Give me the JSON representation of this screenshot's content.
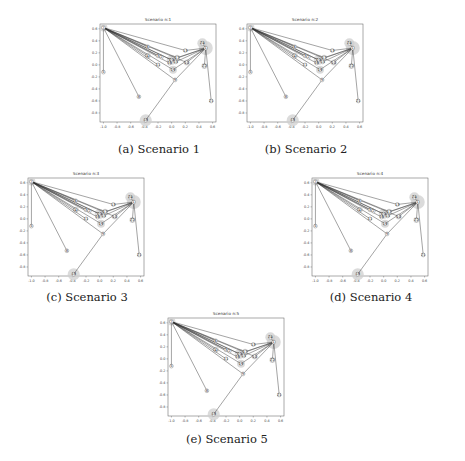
{
  "figure": {
    "panels": [
      {
        "id": "a",
        "title": "Scenario n:1",
        "caption": "(a) Scenario 1"
      },
      {
        "id": "b",
        "title": "Scenario n:2",
        "caption": "(b) Scenario 2"
      },
      {
        "id": "c",
        "title": "Scenario n:3",
        "caption": "(c) Scenario 3"
      },
      {
        "id": "d",
        "title": "Scenario n:4",
        "caption": "(d) Scenario 4"
      },
      {
        "id": "e",
        "title": "Scenario n:5",
        "caption": "(e) Scenario 5"
      }
    ]
  },
  "chart_data": {
    "type": "scatter",
    "xlim": [
      -1.05,
      0.65
    ],
    "ylim": [
      -0.95,
      0.68
    ],
    "xticks": [
      -1.0,
      -0.8,
      -0.6,
      -0.4,
      -0.2,
      0.0,
      0.2,
      0.4,
      0.6
    ],
    "xtick_labels": [
      "-1.0",
      "-0.8",
      "-0.6",
      "-0.4",
      "-0.2",
      "0.0",
      "0.2",
      "0.4",
      "0.6"
    ],
    "yticks": [
      0.6,
      0.4,
      0.2,
      0.0,
      -0.2,
      -0.4,
      -0.6,
      -0.8
    ],
    "ytick_labels": [
      "0.6",
      "0.4",
      "0.2",
      "0.0",
      "-0.2",
      "-0.4",
      "-0.6",
      "-0.8"
    ],
    "grid": false,
    "nodes": [
      {
        "id": "7",
        "x": -1.0,
        "y": 0.62,
        "halo": 4
      },
      {
        "id": "5",
        "x": -1.0,
        "y": -0.12,
        "halo": 0
      },
      {
        "id": "8",
        "x": -0.48,
        "y": -0.53,
        "halo": 0
      },
      {
        "id": "18",
        "x": -0.38,
        "y": -0.92,
        "halo": 6
      },
      {
        "id": "9",
        "x": 0.05,
        "y": -0.25,
        "halo": 0
      },
      {
        "id": "6",
        "x": -0.35,
        "y": 0.3,
        "halo": 0
      },
      {
        "id": "4",
        "x": -0.35,
        "y": 0.15,
        "halo": 3
      },
      {
        "id": "3",
        "x": -0.2,
        "y": 0.15,
        "halo": 0
      },
      {
        "id": "2",
        "x": -0.15,
        "y": 0.13,
        "halo": 0
      },
      {
        "id": "11",
        "x": -0.2,
        "y": 0.0,
        "halo": 0
      },
      {
        "id": "20",
        "x": 0.0,
        "y": 0.08,
        "halo": 5
      },
      {
        "id": "16",
        "x": -0.03,
        "y": 0.03,
        "halo": 0
      },
      {
        "id": "17",
        "x": 0.08,
        "y": 0.12,
        "halo": 3
      },
      {
        "id": "19",
        "x": 0.02,
        "y": -0.08,
        "halo": 4
      },
      {
        "id": "15",
        "x": 0.06,
        "y": 0.05,
        "halo": 0
      },
      {
        "id": "10",
        "x": 0.22,
        "y": 0.04,
        "halo": 3
      },
      {
        "id": "13",
        "x": 0.2,
        "y": 0.24,
        "halo": 0
      },
      {
        "id": "24",
        "x": 0.45,
        "y": 0.36,
        "halo": 5
      },
      {
        "id": "1",
        "x": 0.5,
        "y": 0.28,
        "halo": 7
      },
      {
        "id": "22",
        "x": 0.48,
        "y": -0.02,
        "halo": 3
      },
      {
        "id": "21",
        "x": 0.58,
        "y": -0.6,
        "halo": 2
      }
    ],
    "edges": [
      [
        "7",
        "5"
      ],
      [
        "7",
        "8"
      ],
      [
        "7",
        "6"
      ],
      [
        "7",
        "4"
      ],
      [
        "7",
        "3"
      ],
      [
        "7",
        "2"
      ],
      [
        "7",
        "11"
      ],
      [
        "7",
        "20"
      ],
      [
        "7",
        "16"
      ],
      [
        "7",
        "17"
      ],
      [
        "7",
        "19"
      ],
      [
        "7",
        "15"
      ],
      [
        "7",
        "13"
      ],
      [
        "7",
        "10"
      ],
      [
        "7",
        "9"
      ],
      [
        "18",
        "9"
      ],
      [
        "9",
        "1"
      ],
      [
        "1",
        "24"
      ],
      [
        "1",
        "22"
      ],
      [
        "1",
        "21"
      ],
      [
        "1",
        "13"
      ],
      [
        "1",
        "10"
      ],
      [
        "1",
        "17"
      ],
      [
        "1",
        "15"
      ],
      [
        "1",
        "19"
      ],
      [
        "1",
        "20"
      ]
    ]
  }
}
